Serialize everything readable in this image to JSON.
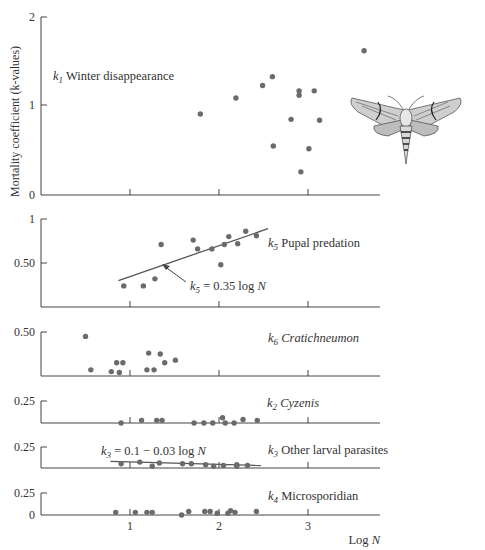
{
  "figure": {
    "ylabel": "Mortality coefficient (k-values)",
    "xlabel": "Log N",
    "x_ticks": [
      "1",
      "2",
      "3"
    ],
    "colors": {
      "axis": "#444444",
      "point": "#6b6b6b",
      "text": "#333333",
      "line": "#555555"
    },
    "illustration": "hawk-moth"
  },
  "chart_data": [
    {
      "id": "k1",
      "type": "scatter",
      "title": "k1 Winter disappearance",
      "label_sub": "1",
      "label_text": "Winter disappearance",
      "italic": false,
      "ylim": [
        0,
        2
      ],
      "yticks": [
        "0",
        "1",
        "2"
      ],
      "xlim": [
        0,
        3.8
      ],
      "points": [
        [
          1.79,
          0.91
        ],
        [
          2.19,
          1.09
        ],
        [
          2.49,
          1.23
        ],
        [
          2.6,
          1.33
        ],
        [
          2.92,
          0.26
        ],
        [
          2.61,
          0.55
        ],
        [
          2.81,
          0.85
        ],
        [
          2.9,
          1.12
        ],
        [
          2.9,
          1.17
        ],
        [
          3.07,
          1.17
        ],
        [
          3.13,
          0.84
        ],
        [
          3.01,
          0.52
        ],
        [
          3.63,
          1.62
        ]
      ]
    },
    {
      "id": "k5",
      "type": "scatter",
      "title": "k5 Pupal predation",
      "label_sub": "5",
      "label_text": "Pupal predation",
      "italic": false,
      "ylim": [
        0,
        1
      ],
      "yticks": [
        "",
        "0.50",
        "1"
      ],
      "xlim": [
        0,
        3.8
      ],
      "fit": {
        "equation": "k5 = 0.35 log N",
        "x": [
          0.87,
          2.55
        ],
        "y": [
          0.3,
          0.89
        ]
      },
      "points": [
        [
          0.93,
          0.24
        ],
        [
          1.15,
          0.24
        ],
        [
          1.28,
          0.32
        ],
        [
          1.35,
          0.71
        ],
        [
          1.71,
          0.76
        ],
        [
          1.76,
          0.66
        ],
        [
          1.92,
          0.66
        ],
        [
          2.02,
          0.48
        ],
        [
          2.06,
          0.71
        ],
        [
          2.11,
          0.8
        ],
        [
          2.21,
          0.72
        ],
        [
          2.3,
          0.86
        ],
        [
          2.42,
          0.81
        ]
      ]
    },
    {
      "id": "k6",
      "type": "scatter",
      "title": "k6 Cratichneumon",
      "label_sub": "6",
      "label_text": "Cratichneumon",
      "italic": true,
      "ylim": [
        0,
        0.5
      ],
      "yticks": [
        "",
        "0.50"
      ],
      "xlim": [
        0,
        3.8
      ],
      "points": [
        [
          0.5,
          0.45
        ],
        [
          0.56,
          0.07
        ],
        [
          0.79,
          0.05
        ],
        [
          0.85,
          0.15
        ],
        [
          0.92,
          0.15
        ],
        [
          0.88,
          0.04
        ],
        [
          1.21,
          0.26
        ],
        [
          1.19,
          0.07
        ],
        [
          1.27,
          0.07
        ],
        [
          1.39,
          0.15
        ],
        [
          1.34,
          0.25
        ],
        [
          1.51,
          0.18
        ]
      ]
    },
    {
      "id": "k2",
      "type": "scatter",
      "title": "k2 Cyzenis",
      "label_sub": "2",
      "label_text": "Cyzenis",
      "italic": true,
      "ylim": [
        0,
        0.25
      ],
      "yticks": [
        "",
        "0.25"
      ],
      "xlim": [
        0,
        3.8
      ],
      "points": [
        [
          0.9,
          0.0
        ],
        [
          1.13,
          0.03
        ],
        [
          1.3,
          0.03
        ],
        [
          1.36,
          0.03
        ],
        [
          1.72,
          0.0
        ],
        [
          1.83,
          0.0
        ],
        [
          1.93,
          0.0
        ],
        [
          2.04,
          0.06
        ],
        [
          2.07,
          0.0
        ],
        [
          2.17,
          0.0
        ],
        [
          2.27,
          0.04
        ],
        [
          2.43,
          0.03
        ]
      ]
    },
    {
      "id": "k3",
      "type": "scatter",
      "title": "k3 Other larval parasites",
      "label_sub": "3",
      "label_text": "Other larval parasites",
      "italic": false,
      "ylim": [
        0,
        0.25
      ],
      "yticks": [
        "",
        "0.25"
      ],
      "xlim": [
        0,
        3.8
      ],
      "fit": {
        "equation": "k3 = 0.1 − 0.03 log N",
        "x": [
          0.78,
          2.47
        ],
        "y": [
          0.08,
          0.03
        ]
      },
      "points": [
        [
          0.9,
          0.05
        ],
        [
          1.11,
          0.07
        ],
        [
          1.25,
          0.02
        ],
        [
          1.33,
          0.06
        ],
        [
          1.59,
          0.05
        ],
        [
          1.69,
          0.05
        ],
        [
          1.85,
          0.04
        ],
        [
          1.94,
          0.02
        ],
        [
          2.05,
          0.03
        ],
        [
          2.2,
          0.04
        ],
        [
          2.2,
          0.02
        ],
        [
          2.32,
          0.03
        ]
      ]
    },
    {
      "id": "k4",
      "type": "scatter",
      "title": "k4 Microsporidian",
      "label_sub": "4",
      "label_text": "Microsporidian",
      "italic": false,
      "ylim": [
        0,
        0.25
      ],
      "yticks": [
        "0",
        "0.25"
      ],
      "xlim": [
        0,
        3.8
      ],
      "points": [
        [
          0.84,
          0.03
        ],
        [
          1.06,
          0.03
        ],
        [
          1.19,
          0.03
        ],
        [
          1.25,
          0.03
        ],
        [
          1.58,
          0.0
        ],
        [
          1.66,
          0.04
        ],
        [
          1.84,
          0.04
        ],
        [
          1.9,
          0.04
        ],
        [
          1.98,
          0.02
        ],
        [
          2.1,
          0.02
        ],
        [
          2.13,
          0.05
        ],
        [
          2.18,
          0.03
        ],
        [
          2.42,
          0.04
        ]
      ]
    }
  ]
}
